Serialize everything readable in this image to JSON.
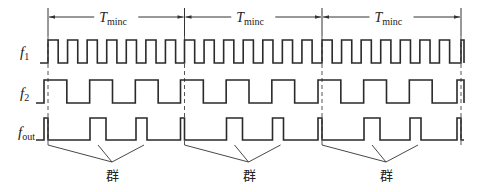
{
  "diagram": {
    "type": "timing-diagram",
    "period_label": {
      "main": "T",
      "subscript": "minc"
    },
    "signals": [
      {
        "id": "f1",
        "label_main": "f",
        "label_sub": "1",
        "pulses_per_period": 7
      },
      {
        "id": "f2",
        "label_main": "f",
        "label_sub": "2",
        "pulses_per_period": 3
      },
      {
        "id": "fout",
        "label_main": "f",
        "label_sub": "out",
        "pulses_per_period": 3
      }
    ],
    "periods": 3,
    "group_label": "群",
    "group_count": 3
  }
}
